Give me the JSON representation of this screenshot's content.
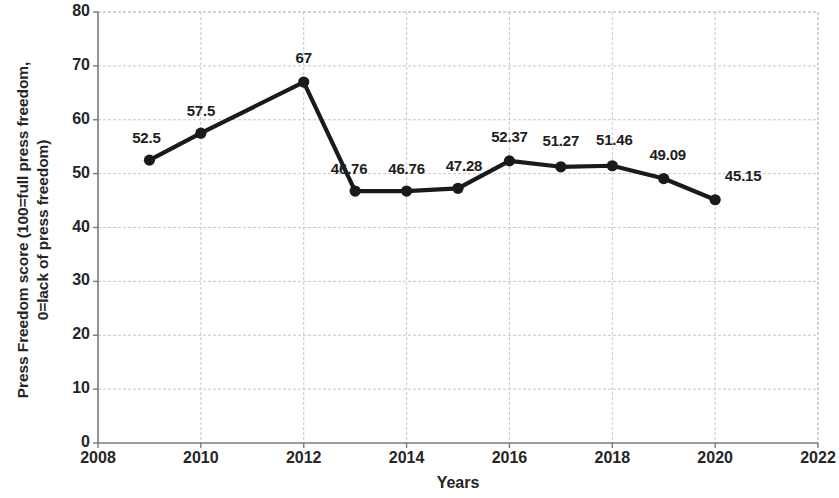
{
  "chart_data": {
    "type": "line",
    "title": "",
    "xlabel": "Years",
    "ylabel": "Press Freedom score (100=full press freedom, 0=lack of press freedom)",
    "ylabel_lines": [
      "Press Freedom score (100=full press freedom,",
      "0=lack of press freedom)"
    ],
    "x": [
      2009,
      2010,
      2012,
      2013,
      2014,
      2015,
      2016,
      2017,
      2018,
      2019,
      2020
    ],
    "values": [
      52.5,
      57.5,
      67,
      46.76,
      46.76,
      47.28,
      52.37,
      51.27,
      51.46,
      49.09,
      45.15
    ],
    "point_labels": [
      "52.5",
      "57.5",
      "67",
      "46.76",
      "46.76",
      "47.28",
      "52.37",
      "51.27",
      "51.46",
      "49.09",
      "45.15"
    ],
    "xlim": [
      2008,
      2022
    ],
    "ylim": [
      0,
      80
    ],
    "xticks": [
      "2008",
      "2010",
      "2012",
      "2014",
      "2016",
      "2018",
      "2020",
      "2022"
    ],
    "xtick_values": [
      2008,
      2010,
      2012,
      2014,
      2016,
      2018,
      2020,
      2022
    ],
    "yticks": [
      "0",
      "10",
      "20",
      "30",
      "40",
      "50",
      "60",
      "70",
      "80"
    ],
    "ytick_values": [
      0,
      10,
      20,
      30,
      40,
      50,
      60,
      70,
      80
    ],
    "grid": true,
    "legend": false,
    "line_color": "#1a1a1a",
    "marker_color": "#1a1a1a",
    "grid_color": "#bfbfbf",
    "axis_color": "#808080",
    "background": "#ffffff"
  }
}
